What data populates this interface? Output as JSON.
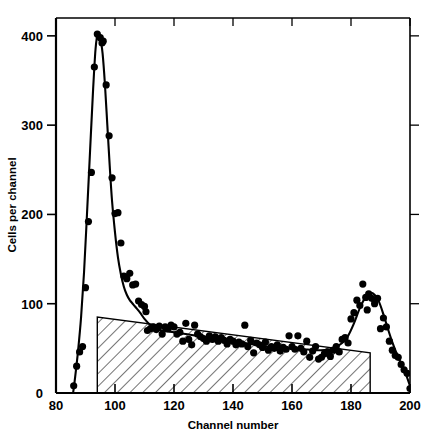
{
  "chart_data": {
    "type": "scatter",
    "title": "",
    "xlabel": "Channel number",
    "ylabel": "Cells per channel",
    "xlim": [
      80,
      200
    ],
    "ylim": [
      0,
      420
    ],
    "grid": false,
    "legend": "none",
    "xticks": [
      80,
      100,
      120,
      140,
      160,
      180,
      200
    ],
    "xtick_labels": [
      "80",
      "100",
      "120",
      "140",
      "160",
      "180",
      "200"
    ],
    "yticks": [
      0,
      100,
      200,
      300,
      400
    ],
    "ytick_labels": [
      "0",
      "100",
      "200",
      "300",
      "400"
    ],
    "series": [
      {
        "name": "Cells per channel (measured)",
        "marker": "filled-circle",
        "color": "#000000",
        "points": [
          [
            86,
            8
          ],
          [
            87,
            30
          ],
          [
            88,
            46
          ],
          [
            89,
            52
          ],
          [
            90,
            118
          ],
          [
            91,
            192
          ],
          [
            92,
            247
          ],
          [
            93,
            365
          ],
          [
            94,
            402
          ],
          [
            95,
            398
          ],
          [
            95.6,
            392
          ],
          [
            96,
            394
          ],
          [
            97,
            345
          ],
          [
            98,
            288
          ],
          [
            99,
            241
          ],
          [
            100,
            201
          ],
          [
            101,
            202
          ],
          [
            102,
            168
          ],
          [
            103,
            131
          ],
          [
            104,
            128
          ],
          [
            105,
            134
          ],
          [
            106,
            121
          ],
          [
            107,
            122
          ],
          [
            108,
            103
          ],
          [
            109,
            99
          ],
          [
            110,
            97
          ],
          [
            110.5,
            91
          ],
          [
            111,
            70
          ],
          [
            112,
            72
          ],
          [
            113,
            74
          ],
          [
            114,
            71
          ],
          [
            115,
            75
          ],
          [
            116,
            66
          ],
          [
            117,
            74
          ],
          [
            118,
            72
          ],
          [
            119,
            76
          ],
          [
            120,
            74
          ],
          [
            121,
            66
          ],
          [
            122,
            68
          ],
          [
            123,
            58
          ],
          [
            124,
            78
          ],
          [
            125,
            60
          ],
          [
            126,
            54
          ],
          [
            127,
            76
          ],
          [
            128,
            66
          ],
          [
            129,
            63
          ],
          [
            130,
            61
          ],
          [
            131,
            58
          ],
          [
            132,
            64
          ],
          [
            133,
            60
          ],
          [
            134,
            63
          ],
          [
            135,
            58
          ],
          [
            136,
            62
          ],
          [
            137,
            59
          ],
          [
            138,
            55
          ],
          [
            139,
            60
          ],
          [
            140,
            58
          ],
          [
            141,
            54
          ],
          [
            142,
            57
          ],
          [
            143,
            55
          ],
          [
            144,
            76
          ],
          [
            145,
            52
          ],
          [
            146,
            59
          ],
          [
            147,
            45
          ],
          [
            148,
            56
          ],
          [
            149,
            54
          ],
          [
            150,
            51
          ],
          [
            151,
            57
          ],
          [
            152,
            48
          ],
          [
            153,
            52
          ],
          [
            154,
            50
          ],
          [
            155,
            54
          ],
          [
            156,
            47
          ],
          [
            157,
            51
          ],
          [
            158,
            49
          ],
          [
            159,
            64
          ],
          [
            160,
            52
          ],
          [
            161,
            49
          ],
          [
            162,
            64
          ],
          [
            163,
            50
          ],
          [
            164,
            46
          ],
          [
            165,
            58
          ],
          [
            166,
            40
          ],
          [
            167,
            47
          ],
          [
            168,
            52
          ],
          [
            169,
            38
          ],
          [
            170,
            40
          ],
          [
            171,
            44
          ],
          [
            172,
            46
          ],
          [
            173,
            41
          ],
          [
            174,
            48
          ],
          [
            175,
            52
          ],
          [
            176,
            46
          ],
          [
            177,
            60
          ],
          [
            178,
            62
          ],
          [
            179,
            56
          ],
          [
            180,
            83
          ],
          [
            181,
            90
          ],
          [
            182,
            104
          ],
          [
            183,
            98
          ],
          [
            184,
            122
          ],
          [
            185,
            107
          ],
          [
            185.5,
            93
          ],
          [
            186,
            111
          ],
          [
            187,
            106
          ],
          [
            188,
            100
          ],
          [
            189,
            106
          ],
          [
            190,
            72
          ],
          [
            191,
            84
          ],
          [
            192,
            74
          ],
          [
            193,
            58
          ],
          [
            194,
            48
          ],
          [
            195,
            42
          ],
          [
            196,
            40
          ],
          [
            197,
            32
          ],
          [
            198,
            26
          ],
          [
            199,
            22
          ],
          [
            200,
            5
          ]
        ]
      }
    ],
    "fit_curve": {
      "name": "fitted curve",
      "color": "#000000",
      "points": [
        [
          85.8,
          0
        ],
        [
          86.5,
          18
        ],
        [
          87.5,
          48
        ],
        [
          88.5,
          85
        ],
        [
          89.5,
          135
        ],
        [
          90.5,
          200
        ],
        [
          91.5,
          268
        ],
        [
          92.5,
          335
        ],
        [
          93.4,
          385
        ],
        [
          94.2,
          403
        ],
        [
          95.0,
          398
        ],
        [
          95.8,
          380
        ],
        [
          96.6,
          345
        ],
        [
          97.4,
          300
        ],
        [
          98.2,
          255
        ],
        [
          99.0,
          215
        ],
        [
          100.0,
          180
        ],
        [
          101.0,
          152
        ],
        [
          102.0,
          133
        ],
        [
          103.0,
          119
        ],
        [
          104.0,
          110
        ],
        [
          105.0,
          104
        ],
        [
          106.0,
          100
        ],
        [
          107.0,
          96
        ],
        [
          108.5,
          90
        ],
        [
          110.0,
          83
        ],
        [
          112.0,
          76
        ],
        [
          114.0,
          72
        ],
        [
          116.0,
          70
        ],
        [
          118.0,
          69
        ],
        [
          120.0,
          68
        ],
        [
          124.0,
          66
        ],
        [
          128.0,
          64
        ],
        [
          132.0,
          62
        ],
        [
          136.0,
          60
        ],
        [
          140.0,
          58
        ],
        [
          144.0,
          56
        ],
        [
          148.0,
          54
        ],
        [
          152.0,
          52
        ],
        [
          156.0,
          51
        ],
        [
          160.0,
          50
        ],
        [
          164.0,
          49
        ],
        [
          168.0,
          48
        ],
        [
          171.0,
          48
        ],
        [
          174.0,
          50
        ],
        [
          177.0,
          56
        ],
        [
          179.0,
          64
        ],
        [
          181.0,
          78
        ],
        [
          183.0,
          95
        ],
        [
          185.0,
          108
        ],
        [
          186.5,
          112
        ],
        [
          188.0,
          110
        ],
        [
          189.5,
          102
        ],
        [
          191.0,
          88
        ],
        [
          192.5,
          72
        ],
        [
          194.0,
          57
        ],
        [
          195.5,
          44
        ],
        [
          197.0,
          33
        ],
        [
          198.5,
          22
        ],
        [
          200.0,
          8
        ]
      ]
    },
    "shaded_region": {
      "name": "hatched background region",
      "description": "diagonally hatched polygon beneath the scatter baseline",
      "fill": "none",
      "hatch": "diagonal-lines",
      "vertices": [
        [
          94,
          0
        ],
        [
          94,
          85
        ],
        [
          186.5,
          45
        ],
        [
          186.5,
          0
        ]
      ]
    }
  },
  "axes": {
    "x_axis_title": "Channel number",
    "y_axis_title": "Cells per channel",
    "frame": "box"
  }
}
